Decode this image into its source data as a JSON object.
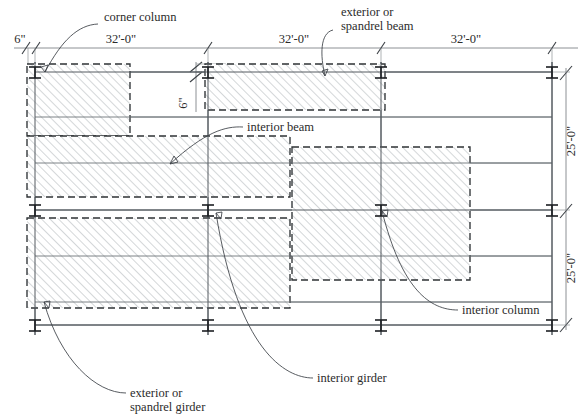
{
  "drawing": {
    "title": "Structural Framing Plan",
    "type": "framing-plan"
  },
  "dimensions": {
    "horizontal": [
      {
        "id": "h-6in",
        "label": "6\"",
        "x": 20,
        "y": 43
      },
      {
        "id": "h-bay-1",
        "label": "32'-0\"",
        "x": 121,
        "y": 43
      },
      {
        "id": "h-bay-2",
        "label": "32'-0\"",
        "x": 294,
        "y": 43
      },
      {
        "id": "h-bay-3",
        "label": "32'-0\"",
        "x": 466,
        "y": 43
      }
    ],
    "vertical": [
      {
        "id": "v-6in",
        "label": "6\"",
        "x": 186,
        "y": 102
      },
      {
        "id": "v-bay-1",
        "label": "25'-0\"",
        "x": 573,
        "y": 141
      },
      {
        "id": "v-bay-2",
        "label": "25'-0\"",
        "x": 573,
        "y": 268
      }
    ]
  },
  "annotations": [
    {
      "id": "corner-column",
      "label": "corner column",
      "x": 104,
      "y": 19
    },
    {
      "id": "exterior-spandrel-beam",
      "label": "exterior or",
      "label2": "spandrel beam",
      "x": 355,
      "y": 13
    },
    {
      "id": "interior-beam",
      "label": "interior beam",
      "x": 247,
      "y": 128
    },
    {
      "id": "interior-column",
      "label": "interior column",
      "x": 462,
      "y": 312
    },
    {
      "id": "interior-girder",
      "label": "interior girder",
      "x": 317,
      "y": 381
    },
    {
      "id": "exterior-spandrel-girder",
      "label": "exterior or",
      "label2": "spandrel girder",
      "x": 130,
      "y": 396
    }
  ],
  "grid": {
    "column_lines_x": [
      35,
      208,
      381,
      552
    ],
    "row_lines_y": [
      72,
      210,
      325
    ],
    "beam_lines_y": [
      72,
      117,
      163,
      210,
      256,
      302,
      325
    ],
    "bay_width_label": "32'-0\"",
    "bay_depth_label": "25'-0\""
  },
  "tributary_areas": [
    {
      "id": "corner-column-area",
      "x": 27,
      "y": 64,
      "w": 103,
      "h": 72
    },
    {
      "id": "interior-beam-area",
      "x": 27,
      "y": 136,
      "w": 263,
      "h": 61
    },
    {
      "id": "spandrel-beam-area",
      "x": 205,
      "y": 64,
      "w": 180,
      "h": 46
    },
    {
      "id": "spandrel-girder-area",
      "x": 27,
      "y": 218,
      "w": 263,
      "h": 90
    },
    {
      "id": "interior-column-area",
      "x": 292,
      "y": 147,
      "w": 178,
      "h": 133
    }
  ],
  "columns": [
    {
      "id": "col-A1",
      "x": 35,
      "y": 72
    },
    {
      "id": "col-B1",
      "x": 208,
      "y": 72
    },
    {
      "id": "col-C1",
      "x": 381,
      "y": 72
    },
    {
      "id": "col-D1",
      "x": 552,
      "y": 72
    },
    {
      "id": "col-A2",
      "x": 35,
      "y": 210
    },
    {
      "id": "col-B2",
      "x": 208,
      "y": 210
    },
    {
      "id": "col-C2",
      "x": 381,
      "y": 210
    },
    {
      "id": "col-D2",
      "x": 552,
      "y": 210
    },
    {
      "id": "col-A3",
      "x": 35,
      "y": 325
    },
    {
      "id": "col-B3",
      "x": 208,
      "y": 325
    },
    {
      "id": "col-C3",
      "x": 381,
      "y": 325
    },
    {
      "id": "col-D3",
      "x": 552,
      "y": 325
    }
  ],
  "colors": {
    "line": "#555b60",
    "beam": "#6e7478",
    "hatch": "#9aa0a4",
    "dashed": "#2f3336",
    "text": "#2b2b2b",
    "background": "#ffffff"
  }
}
